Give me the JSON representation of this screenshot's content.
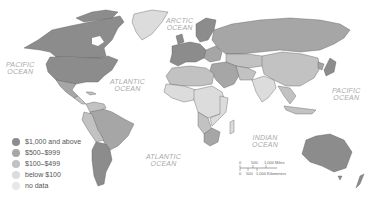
{
  "map": {
    "ocean_labels": [
      {
        "id": "arctic",
        "line1": "ARCTIC",
        "line2": "OCEAN"
      },
      {
        "id": "pacific-west",
        "line1": "PACIFIC",
        "line2": "OCEAN"
      },
      {
        "id": "atlantic-north",
        "line1": "ATLANTIC",
        "line2": "OCEAN"
      },
      {
        "id": "pacific-east",
        "line1": "PACIFIC",
        "line2": "OCEAN"
      },
      {
        "id": "indian",
        "line1": "INDIAN",
        "line2": "OCEAN"
      },
      {
        "id": "atlantic-south",
        "line1": "ATLANTIC",
        "line2": "OCEAN"
      }
    ],
    "legend": {
      "items": [
        {
          "label": "$1,000 and above",
          "color": "#8c8c8c"
        },
        {
          "label": "$500–$999",
          "color": "#a6a6a6"
        },
        {
          "label": "$100–$499",
          "color": "#c2c2c2"
        },
        {
          "label": "below $100",
          "color": "#dcdcdc"
        },
        {
          "label": "no data",
          "color": "#e8e8e8"
        }
      ]
    },
    "scale_bar": {
      "miles": {
        "ticks": [
          "0",
          "500",
          "1,000 Miles"
        ]
      },
      "kilometers": {
        "ticks": [
          "0",
          "500",
          "1,000 Kilometers"
        ]
      }
    },
    "colors": {
      "ocean": "#ffffff",
      "border": "#555555",
      "tier1": "#8c8c8c",
      "tier2": "#a6a6a6",
      "tier3": "#c2c2c2",
      "tier4": "#dcdcdc",
      "nodata": "#e8e8e8"
    }
  }
}
